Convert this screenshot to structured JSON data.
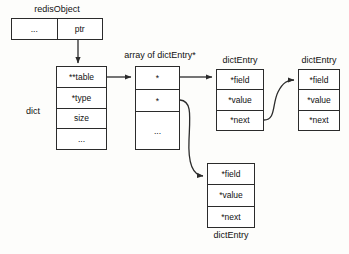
{
  "diagram": {
    "background_color": "#fdfdfb",
    "line_color": "#2b2b2b",
    "box_fill": "#ffffff"
  },
  "redis_object": {
    "caption": "redisObject",
    "cells": [
      "...",
      "ptr"
    ]
  },
  "dict": {
    "caption": "dict",
    "cells": [
      "**table",
      "*type",
      "size",
      "..."
    ]
  },
  "array": {
    "caption": "array of dictEntry*",
    "cells": [
      "*",
      "*",
      "..."
    ]
  },
  "entry1": {
    "caption": "dictEntry",
    "cells": [
      "*field",
      "*value",
      "*next"
    ]
  },
  "entry2": {
    "caption": "dictEntry",
    "cells": [
      "*field",
      "*value",
      "*next"
    ]
  },
  "entry3": {
    "caption": "dictEntry",
    "cells": [
      "*field",
      "*value",
      "*next"
    ]
  }
}
